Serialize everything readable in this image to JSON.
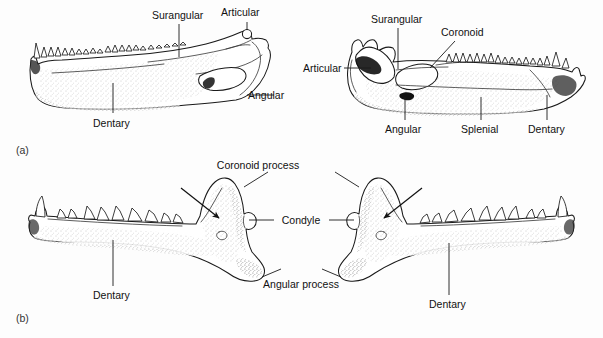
{
  "figure": {
    "background_color": "#fdfdfd",
    "ink_color": "#1a1a1a"
  },
  "panels": [
    {
      "id": "a",
      "panel_label": "(a)",
      "caption": "Reptilian lower jaws composed of multiple bones",
      "specimens": [
        {
          "id": "a-left",
          "orientation": "anterior-left",
          "labels": [
            {
              "text": "Surangular",
              "name": "label-surangular"
            },
            {
              "text": "Articular",
              "name": "label-articular"
            },
            {
              "text": "Angular",
              "name": "label-angular"
            },
            {
              "text": "Dentary",
              "name": "label-dentary"
            }
          ]
        },
        {
          "id": "a-right",
          "orientation": "anterior-right",
          "labels": [
            {
              "text": "Surangular",
              "name": "label-surangular"
            },
            {
              "text": "Coronoid",
              "name": "label-coronoid"
            },
            {
              "text": "Articular",
              "name": "label-articular"
            },
            {
              "text": "Angular",
              "name": "label-angular"
            },
            {
              "text": "Splenial",
              "name": "label-splenial"
            },
            {
              "text": "Dentary",
              "name": "label-dentary"
            }
          ]
        }
      ]
    },
    {
      "id": "b",
      "panel_label": "(b)",
      "caption": "Mammalian lower jaws formed by a single dentary bone",
      "shared_labels": [
        {
          "text": "Coronoid process",
          "name": "label-coronoid-process"
        },
        {
          "text": "Condyle",
          "name": "label-condyle"
        },
        {
          "text": "Angular process",
          "name": "label-angular-process"
        }
      ],
      "specimens": [
        {
          "id": "b-left",
          "orientation": "anterior-left",
          "labels": [
            {
              "text": "Dentary",
              "name": "label-dentary"
            }
          ]
        },
        {
          "id": "b-right",
          "orientation": "anterior-right",
          "labels": [
            {
              "text": "Dentary",
              "name": "label-dentary"
            }
          ]
        }
      ]
    }
  ],
  "text": {
    "panel_a": "(a)",
    "panel_b": "(b)",
    "surangular": "Surangular",
    "articular": "Articular",
    "angular": "Angular",
    "dentary": "Dentary",
    "coronoid": "Coronoid",
    "splenial": "Splenial",
    "coronoid_process": "Coronoid process",
    "condyle": "Condyle",
    "angular_process": "Angular process"
  }
}
